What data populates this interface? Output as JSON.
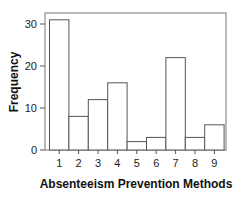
{
  "chart_data": {
    "type": "bar",
    "title": "",
    "xlabel": "Absenteeism Prevention Methods",
    "ylabel": "Frequency",
    "categories": [
      "1",
      "2",
      "3",
      "4",
      "5",
      "6",
      "7",
      "8",
      "9"
    ],
    "values": [
      31,
      8,
      12,
      16,
      2,
      3,
      22,
      3,
      6
    ],
    "ylim": [
      0,
      33
    ],
    "yticks": [
      0,
      10,
      20,
      30
    ],
    "grid": false,
    "legend": null,
    "bar_fill": "#ffffff",
    "bar_stroke": "#555555"
  }
}
